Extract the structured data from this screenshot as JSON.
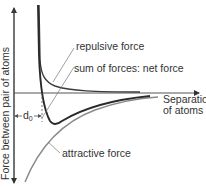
{
  "diagram": {
    "type": "force-vs-separation",
    "y_axis_label": "Force between pair of atoms",
    "x_axis_label_line1": "Separation",
    "x_axis_label_line2": "of atoms",
    "curves": {
      "repulsive": {
        "label": "repulsive force",
        "color": "#3a3a3a"
      },
      "net": {
        "label": "sum of forces: net force",
        "color": "#2a2a2a"
      },
      "attractive": {
        "label": "attractive force",
        "color": "#8a8a8a"
      }
    },
    "equilibrium_marker": {
      "symbol": "d",
      "subscript": "0"
    }
  }
}
